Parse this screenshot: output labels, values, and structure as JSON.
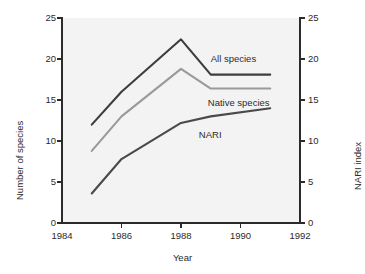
{
  "chart_data": {
    "type": "line",
    "title": "",
    "xlabel": "Year",
    "ylabel": "Number of species",
    "y2label": "NARI index",
    "xlim": [
      1984,
      1992
    ],
    "ylim": [
      0,
      25
    ],
    "y2lim": [
      0,
      25
    ],
    "grid": false,
    "legend_position": "inline-right-of-lines",
    "x_ticks": [
      "1984",
      "1986",
      "1988",
      "1990",
      "1992"
    ],
    "x_tick_values": [
      1984,
      1986,
      1988,
      1990,
      1992
    ],
    "y_ticks": [
      "0",
      "5",
      "10",
      "15",
      "20",
      "25"
    ],
    "y_tick_values": [
      0,
      5,
      10,
      15,
      20,
      25
    ],
    "y2_ticks": [
      "0",
      "5",
      "10",
      "15",
      "20",
      "25"
    ],
    "y2_tick_values": [
      0,
      5,
      10,
      15,
      20,
      25
    ],
    "x": [
      1985,
      1986,
      1988,
      1989,
      1991
    ],
    "series": [
      {
        "name": "All species",
        "axis": "left",
        "color": "#3d3d3d",
        "values": [
          12.0,
          16.0,
          22.4,
          18.1,
          18.1
        ],
        "label_x": 1989.0,
        "label_y": 20.0
      },
      {
        "name": "Native species",
        "axis": "left",
        "color": "#9a9a9a",
        "values": [
          8.8,
          13.0,
          18.8,
          16.4,
          16.4
        ],
        "label_x": 1988.9,
        "label_y": 14.6
      },
      {
        "name": "NARI",
        "axis": "right",
        "color": "#4a4a4a",
        "values": [
          3.6,
          7.8,
          12.2,
          13.0,
          14.0
        ],
        "label_x": 1988.6,
        "label_y": 10.7
      }
    ]
  },
  "axes": {
    "x_title": "Year",
    "y_left_title": "Number of species",
    "y_right_title": "NARI index"
  }
}
